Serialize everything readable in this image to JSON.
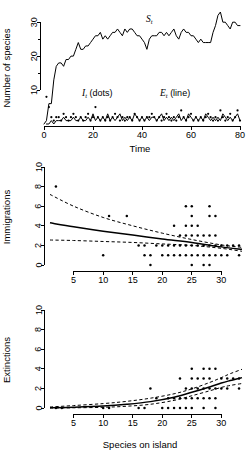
{
  "figure": {
    "name": "island-biogeography-three-panel-figure"
  },
  "panels": {
    "species": {
      "name": "Number of species time series",
      "ylabel": "Number of species",
      "xlabel": "Time",
      "yticks": [
        10,
        20,
        30
      ],
      "ytick_labels": [
        "10",
        "20",
        "30"
      ],
      "xticks": [
        0,
        20,
        40,
        60,
        80
      ],
      "xtick_labels": [
        "0",
        "20",
        "40",
        "60",
        "80"
      ],
      "annotations": {
        "st": {
          "base": "S",
          "sub": "t",
          "suffix": ""
        },
        "it": {
          "base": "I",
          "sub": "t",
          "suffix": " (dots)"
        },
        "et": {
          "base": "E",
          "sub": "t",
          "suffix": " (line)"
        }
      }
    },
    "immigrations": {
      "name": "Immigrations vs species on island",
      "ylabel": "Immigrations",
      "xlabel": "",
      "yticks": [
        0,
        2,
        4,
        6,
        8,
        10
      ],
      "ytick_labels": [
        "0",
        "2",
        "4",
        "6",
        "8",
        "10"
      ],
      "xticks": [
        5,
        10,
        15,
        20,
        25,
        30
      ],
      "xtick_labels": [
        "5",
        "10",
        "15",
        "20",
        "25",
        "30"
      ]
    },
    "extinctions": {
      "name": "Extinctions vs species on island",
      "ylabel": "Extinctions",
      "xlabel": "Species on island",
      "yticks": [
        0,
        2,
        4,
        6,
        8,
        10
      ],
      "ytick_labels": [
        "0",
        "2",
        "4",
        "6",
        "8",
        "10"
      ],
      "xticks": [
        5,
        10,
        15,
        20,
        25,
        30
      ],
      "xtick_labels": [
        "5",
        "10",
        "15",
        "20",
        "25",
        "30"
      ]
    }
  },
  "chart_data": [
    {
      "type": "line",
      "title": "",
      "panel": "species",
      "xlabel": "Time",
      "ylabel": "Number of species",
      "xlim": [
        0,
        80
      ],
      "ylim": [
        0,
        33
      ],
      "grid": false,
      "legend": "in-plot annotations",
      "series": [
        {
          "name": "S_t",
          "style": "line",
          "x": [
            0,
            1,
            2,
            3,
            4,
            5,
            6,
            7,
            8,
            9,
            10,
            11,
            12,
            13,
            14,
            15,
            16,
            17,
            18,
            19,
            20,
            21,
            22,
            23,
            24,
            25,
            26,
            27,
            28,
            29,
            30,
            31,
            32,
            33,
            34,
            35,
            36,
            37,
            38,
            39,
            40,
            41,
            42,
            43,
            44,
            45,
            46,
            47,
            48,
            49,
            50,
            51,
            52,
            53,
            54,
            55,
            56,
            57,
            58,
            59,
            60,
            61,
            62,
            63,
            64,
            65,
            66,
            67,
            68,
            69,
            70,
            71,
            72,
            73,
            74,
            75,
            76,
            77,
            78,
            79,
            80
          ],
          "values": [
            0,
            1,
            6,
            6,
            13,
            17,
            18,
            18,
            17,
            19,
            19,
            20,
            20,
            22,
            24,
            22,
            22,
            23,
            23,
            24,
            25,
            26,
            26,
            27,
            25,
            26,
            25,
            26,
            27,
            27,
            28,
            27,
            26,
            28,
            27,
            28,
            28,
            27,
            26,
            26,
            25,
            24,
            22,
            25,
            26,
            26,
            26,
            27,
            27,
            26,
            27,
            26,
            27,
            28,
            26,
            25,
            27,
            28,
            27,
            27,
            26,
            26,
            25,
            24,
            25,
            24,
            24,
            24,
            24,
            27,
            29,
            32,
            33,
            30,
            30,
            29,
            28,
            30,
            30,
            29,
            29
          ]
        },
        {
          "name": "I_t",
          "style": "dots",
          "x": [
            1,
            2,
            3,
            4,
            5,
            6,
            7,
            8,
            9,
            10,
            11,
            12,
            13,
            14,
            15,
            16,
            17,
            18,
            19,
            20,
            21,
            22,
            23,
            24,
            25,
            26,
            27,
            28,
            29,
            30,
            31,
            32,
            33,
            34,
            35,
            36,
            37,
            38,
            39,
            40,
            41,
            42,
            43,
            44,
            45,
            46,
            47,
            48,
            49,
            50,
            51,
            52,
            53,
            54,
            55,
            56,
            57,
            58,
            59,
            60,
            61,
            62,
            63,
            64,
            65,
            66,
            67,
            68,
            69,
            70,
            71,
            72,
            73,
            74,
            75,
            76,
            77,
            78,
            79,
            80
          ],
          "values": [
            8,
            5,
            2,
            1,
            2,
            2,
            1,
            3,
            2,
            1,
            2,
            3,
            2,
            1,
            2,
            1,
            2,
            3,
            1,
            2,
            5,
            2,
            1,
            2,
            1,
            2,
            1,
            2,
            3,
            2,
            1,
            2,
            1,
            2,
            2,
            1,
            3,
            2,
            1,
            2,
            1,
            2,
            2,
            3,
            2,
            1,
            2,
            1,
            2,
            3,
            2,
            1,
            2,
            1,
            2,
            4,
            2,
            1,
            2,
            3,
            1,
            2,
            1,
            2,
            1,
            2,
            3,
            2,
            1,
            2,
            1,
            4,
            2,
            1,
            2,
            3,
            1,
            2,
            4,
            1
          ]
        },
        {
          "name": "E_t",
          "style": "line",
          "x": [
            1,
            2,
            3,
            4,
            5,
            6,
            7,
            8,
            9,
            10,
            11,
            12,
            13,
            14,
            15,
            16,
            17,
            18,
            19,
            20,
            21,
            22,
            23,
            24,
            25,
            26,
            27,
            28,
            29,
            30,
            31,
            32,
            33,
            34,
            35,
            36,
            37,
            38,
            39,
            40,
            41,
            42,
            43,
            44,
            45,
            46,
            47,
            48,
            49,
            50,
            51,
            52,
            53,
            54,
            55,
            56,
            57,
            58,
            59,
            60,
            61,
            62,
            63,
            64,
            65,
            66,
            67,
            68,
            69,
            70,
            71,
            72,
            73,
            74,
            75,
            76,
            77,
            78,
            79,
            80
          ],
          "values": [
            0,
            0,
            1,
            0,
            1,
            1,
            1,
            2,
            1,
            1,
            1,
            2,
            1,
            1,
            2,
            1,
            1,
            2,
            1,
            3,
            1,
            2,
            1,
            2,
            1,
            3,
            1,
            2,
            1,
            2,
            3,
            1,
            2,
            1,
            2,
            1,
            3,
            2,
            1,
            2,
            1,
            2,
            1,
            2,
            2,
            1,
            2,
            3,
            1,
            2,
            1,
            2,
            1,
            2,
            3,
            1,
            2,
            1,
            3,
            2,
            1,
            2,
            1,
            2,
            1,
            3,
            2,
            1,
            2,
            1,
            2,
            1,
            3,
            2,
            1,
            2,
            1,
            2,
            3,
            1
          ]
        }
      ]
    },
    {
      "type": "scatter",
      "panel": "immigrations",
      "title": "",
      "xlabel": "",
      "ylabel": "Immigrations",
      "xlim": [
        1,
        33.5
      ],
      "ylim": [
        0,
        10
      ],
      "grid": false,
      "points": [
        [
          2,
          8
        ],
        [
          10,
          1
        ],
        [
          11,
          5
        ],
        [
          14,
          5
        ],
        [
          16,
          2
        ],
        [
          17,
          2
        ],
        [
          17,
          1
        ],
        [
          18,
          1
        ],
        [
          18,
          0
        ],
        [
          19,
          2
        ],
        [
          20,
          2
        ],
        [
          20,
          1
        ],
        [
          21,
          1
        ],
        [
          21,
          2
        ],
        [
          22,
          1
        ],
        [
          22,
          4
        ],
        [
          22,
          2
        ],
        [
          23,
          1
        ],
        [
          23,
          2
        ],
        [
          23,
          3
        ],
        [
          24,
          3
        ],
        [
          24,
          4
        ],
        [
          24,
          6
        ],
        [
          24,
          1
        ],
        [
          24,
          2
        ],
        [
          25,
          6
        ],
        [
          25,
          5
        ],
        [
          25,
          4
        ],
        [
          25,
          3
        ],
        [
          25,
          2
        ],
        [
          25,
          1
        ],
        [
          25,
          0
        ],
        [
          26,
          3
        ],
        [
          26,
          2
        ],
        [
          26,
          1
        ],
        [
          26,
          4
        ],
        [
          27,
          3
        ],
        [
          27,
          2
        ],
        [
          27,
          1
        ],
        [
          27,
          0
        ],
        [
          28,
          5
        ],
        [
          28,
          6
        ],
        [
          28,
          3
        ],
        [
          28,
          2
        ],
        [
          28,
          1
        ],
        [
          28,
          0
        ],
        [
          29,
          5
        ],
        [
          29,
          2
        ],
        [
          29,
          1
        ],
        [
          29,
          3
        ],
        [
          30,
          2
        ],
        [
          30,
          1
        ],
        [
          31,
          2
        ],
        [
          31,
          1
        ],
        [
          32,
          2
        ],
        [
          33,
          2
        ],
        [
          33,
          1
        ]
      ],
      "fit": {
        "name": "fitted-glm",
        "x": [
          1,
          5,
          10,
          15,
          20,
          25,
          30,
          33.5
        ],
        "values": [
          4.3,
          3.9,
          3.45,
          3.05,
          2.65,
          2.3,
          1.85,
          1.6
        ]
      },
      "ci_upper": {
        "name": "upper-confidence-band",
        "x": [
          1,
          5,
          10,
          15,
          20,
          25,
          30,
          33.5
        ],
        "values": [
          7.2,
          6.0,
          4.85,
          4.0,
          3.25,
          2.6,
          2.05,
          1.8
        ]
      },
      "ci_lower": {
        "name": "lower-confidence-band",
        "x": [
          1,
          5,
          10,
          15,
          20,
          25,
          30,
          33.5
        ],
        "values": [
          2.55,
          2.5,
          2.4,
          2.3,
          2.15,
          2.0,
          1.7,
          1.4
        ]
      }
    },
    {
      "type": "scatter",
      "panel": "extinctions",
      "title": "",
      "xlabel": "Species on island",
      "ylabel": "Extinctions",
      "xlim": [
        1,
        33.5
      ],
      "ylim": [
        0,
        10
      ],
      "grid": false,
      "points": [
        [
          2,
          0
        ],
        [
          3,
          0
        ],
        [
          10,
          0
        ],
        [
          11,
          0
        ],
        [
          16,
          0
        ],
        [
          17,
          0
        ],
        [
          18,
          2
        ],
        [
          19,
          1
        ],
        [
          20,
          0
        ],
        [
          21,
          0
        ],
        [
          21,
          1
        ],
        [
          22,
          0
        ],
        [
          22,
          1
        ],
        [
          23,
          3
        ],
        [
          23,
          1
        ],
        [
          23,
          0
        ],
        [
          24,
          1
        ],
        [
          24,
          2
        ],
        [
          24,
          0
        ],
        [
          25,
          4
        ],
        [
          25,
          3
        ],
        [
          25,
          2
        ],
        [
          25,
          1
        ],
        [
          25,
          0
        ],
        [
          26,
          2
        ],
        [
          26,
          1
        ],
        [
          26,
          3
        ],
        [
          27,
          4
        ],
        [
          27,
          3
        ],
        [
          27,
          2
        ],
        [
          27,
          1
        ],
        [
          27,
          0
        ],
        [
          28,
          4
        ],
        [
          28,
          2
        ],
        [
          28,
          1
        ],
        [
          28,
          3
        ],
        [
          29,
          4
        ],
        [
          29,
          2
        ],
        [
          29,
          1
        ],
        [
          29,
          0
        ],
        [
          30,
          2
        ],
        [
          30,
          3
        ],
        [
          31,
          2
        ],
        [
          31,
          3
        ],
        [
          32,
          3
        ],
        [
          33,
          3
        ],
        [
          33,
          2
        ]
      ],
      "fit": {
        "name": "fitted-glm",
        "x": [
          1,
          5,
          10,
          14,
          18,
          22,
          25,
          28,
          30,
          31.5,
          33.5
        ],
        "values": [
          0.02,
          0.08,
          0.2,
          0.38,
          0.65,
          1.1,
          1.6,
          2.15,
          2.55,
          2.8,
          3.1
        ]
      },
      "ci_upper": {
        "name": "upper-confidence-band",
        "x": [
          1,
          5,
          10,
          14,
          18,
          22,
          25,
          28,
          30,
          31.5,
          33.5
        ],
        "values": [
          0.1,
          0.25,
          0.45,
          0.68,
          1.0,
          1.45,
          1.95,
          2.6,
          3.1,
          3.5,
          3.95
        ]
      },
      "ci_lower": {
        "name": "lower-confidence-band",
        "x": [
          1,
          5,
          10,
          14,
          18,
          22,
          25,
          28,
          30,
          31.5,
          33.5
        ],
        "values": [
          0.0,
          0.02,
          0.07,
          0.18,
          0.38,
          0.78,
          1.25,
          1.75,
          2.1,
          2.3,
          2.5
        ]
      }
    }
  ]
}
